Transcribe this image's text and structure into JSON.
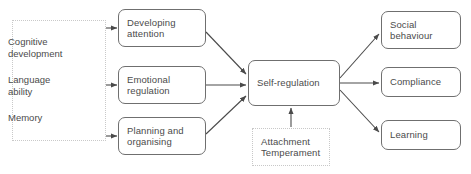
{
  "diagram": {
    "colors": {
      "box_border": "#6f6f6f",
      "dotted_border": "#c9c9c9",
      "text": "#4b4b4b",
      "arrow": "#4a4a4a",
      "background": "#ffffff"
    },
    "input_group": {
      "name": "cognitive-inputs-group",
      "items": [
        {
          "id": "cognitive-development",
          "label": "Cognitive\ndevelopment",
          "x": 8,
          "y": 16
        },
        {
          "id": "language-ability",
          "label": "Language\nability",
          "x": 8,
          "y": 54
        },
        {
          "id": "memory",
          "label": "Memory",
          "x": 8,
          "y": 92
        }
      ]
    },
    "nodes": [
      {
        "id": "developing-attention",
        "label": "Developing\nattention",
        "x": 118,
        "y": 9,
        "w": 88,
        "h": 38,
        "style": "rounded"
      },
      {
        "id": "emotional-regulation",
        "label": "Emotional\nregulation",
        "x": 118,
        "y": 66,
        "w": 88,
        "h": 38,
        "style": "rounded"
      },
      {
        "id": "planning-and-organising",
        "label": "Planning and\norganising",
        "x": 118,
        "y": 117,
        "w": 88,
        "h": 38,
        "style": "rounded"
      },
      {
        "id": "self-regulation",
        "label": "Self-regulation",
        "x": 248,
        "y": 60,
        "w": 92,
        "h": 46,
        "style": "rounded"
      },
      {
        "id": "attachment-temperament",
        "label": "Attachment\nTemperament",
        "x": 252,
        "y": 128,
        "w": 78,
        "h": 38,
        "style": "dotted"
      },
      {
        "id": "social-behaviour",
        "label": "Social\nbehaviour",
        "x": 381,
        "y": 11,
        "w": 80,
        "h": 38,
        "style": "rounded"
      },
      {
        "id": "compliance",
        "label": "Compliance",
        "x": 381,
        "y": 67,
        "w": 80,
        "h": 30,
        "style": "rounded"
      },
      {
        "id": "learning",
        "label": "Learning",
        "x": 381,
        "y": 120,
        "w": 80,
        "h": 30,
        "style": "rounded"
      }
    ],
    "edges": [
      {
        "id": "edge-group-to-attention",
        "from": "cognitive-inputs-group",
        "to": "developing-attention",
        "kind": "bidirectional"
      },
      {
        "id": "edge-group-to-emotional",
        "from": "cognitive-inputs-group",
        "to": "emotional-regulation",
        "kind": "bidirectional"
      },
      {
        "id": "edge-group-to-planning",
        "from": "cognitive-inputs-group",
        "to": "planning-and-organising",
        "kind": "bidirectional"
      },
      {
        "id": "edge-attention-to-self",
        "from": "developing-attention",
        "to": "self-regulation",
        "kind": "directed"
      },
      {
        "id": "edge-emotional-to-self",
        "from": "emotional-regulation",
        "to": "self-regulation",
        "kind": "directed"
      },
      {
        "id": "edge-planning-to-self",
        "from": "planning-and-organising",
        "to": "self-regulation",
        "kind": "directed"
      },
      {
        "id": "edge-attachment-to-self",
        "from": "attachment-temperament",
        "to": "self-regulation",
        "kind": "directed"
      },
      {
        "id": "edge-self-to-social",
        "from": "self-regulation",
        "to": "social-behaviour",
        "kind": "directed"
      },
      {
        "id": "edge-self-to-compliance",
        "from": "self-regulation",
        "to": "compliance",
        "kind": "directed"
      },
      {
        "id": "edge-self-to-learning",
        "from": "self-regulation",
        "to": "learning",
        "kind": "directed"
      }
    ]
  }
}
